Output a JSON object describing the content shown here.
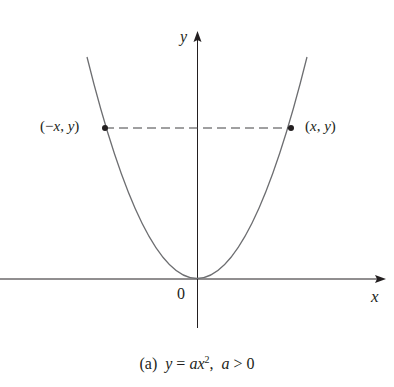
{
  "figure": {
    "caption": {
      "label": "(a)",
      "equation_lhs": "y",
      "equals": " = ",
      "coef": "a",
      "var": "x",
      "exponent": "2",
      "sep": ", ",
      "cond_var": "a",
      "cond_op": " > ",
      "cond_val": "0"
    },
    "axes": {
      "x_label": "x",
      "y_label": "y",
      "origin_label": "0"
    },
    "points": {
      "left": "(−x, y)",
      "left_parts": {
        "open": "(",
        "neg": "−",
        "x": "x",
        "comma": ", ",
        "y": "y",
        "close": ")"
      },
      "right_parts": {
        "open": "(",
        "x": "x",
        "comma": ", ",
        "y": "y",
        "close": ")"
      }
    },
    "colors": {
      "curve": "#6d6e71",
      "axis": "#231f20",
      "dashed": "#414042",
      "point": "#231f20"
    }
  }
}
